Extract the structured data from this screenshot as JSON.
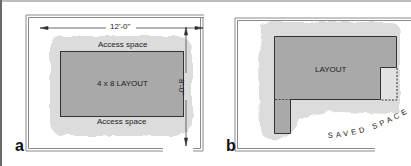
{
  "panels": {
    "a": {
      "label": "a",
      "dimension_width": "12'-0\"",
      "dimension_height": "8'-0\"",
      "access_top": "Access space",
      "access_bottom": "Access space",
      "layout_label": "4 x 8 LAYOUT"
    },
    "b": {
      "label": "b",
      "layout_label": "LAYOUT",
      "saved_space_label": "SAVED SPACE"
    }
  },
  "colors": {
    "layout_fill": "#a9a9a9",
    "access_fill": "#dcdcdc",
    "saved_fill": "#e2e2e2",
    "wall": "#8a8a8a",
    "outline": "#333333"
  }
}
